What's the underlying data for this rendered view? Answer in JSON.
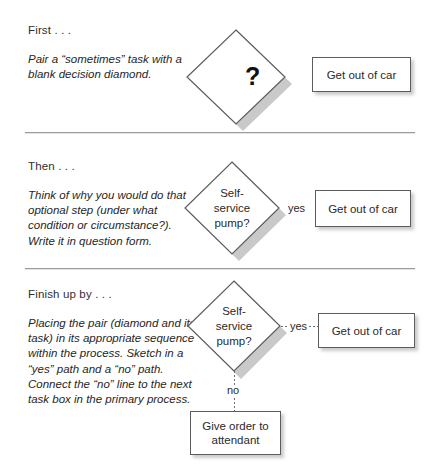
{
  "page": {
    "background_color": "#ffffff",
    "shape_outline_color": "#5c5c5c",
    "divider_color": "#9b9b9b"
  },
  "sections": [
    {
      "heading": "First . . .",
      "body": "Pair a “sometimes” task with a blank decision diamond.",
      "diamond_label": "",
      "diamond_question_mark": "?",
      "task_label": "Get out of car"
    },
    {
      "heading": "Then . . .",
      "body": "Think of why you would do that optional step (under what condition or circumstance?). Write it in question form.",
      "diamond_line1": "Self-",
      "diamond_line2": "service",
      "diamond_line3": "pump?",
      "edge_label_yes": "yes",
      "task_label": "Get out of car"
    },
    {
      "heading": "Finish up by . . .",
      "body": "Placing the pair (diamond and its task) in its appropriate sequence within the process. Sketch in a “yes” path and a “no” path. Connect the “no” line to the next task box in the primary process.",
      "diamond_line1": "Self-",
      "diamond_line2": "service",
      "diamond_line3": "pump?",
      "edge_label_yes": "yes",
      "edge_label_no": "no",
      "task_label_yes": "Get out of car",
      "task_label_no_line1": "Give order to",
      "task_label_no_line2": "attendant"
    }
  ]
}
